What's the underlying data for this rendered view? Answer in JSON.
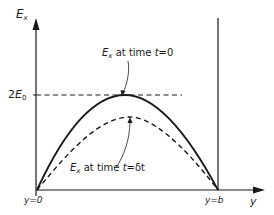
{
  "diagram": {
    "y_axis_label": {
      "main": "E",
      "sub": "x"
    },
    "x_axis_label": "y",
    "level_label": {
      "prefix": "2",
      "main": "E",
      "sub": "0"
    },
    "boundary_left": "y=0",
    "boundary_right": "y=b",
    "curve_solid_label": {
      "main": "E",
      "sub": "x",
      "text": " at time ",
      "var": "t",
      "eq": "=0"
    },
    "curve_dashed_label": {
      "main": "E",
      "sub": "x",
      "text": " at time ",
      "var": "t",
      "eq": "=δt"
    },
    "colors": {
      "ink": "#1a1a1a",
      "background": "#ffffff"
    }
  }
}
